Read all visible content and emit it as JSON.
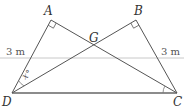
{
  "diagram": {
    "type": "geometry",
    "colors": {
      "line": "#555555",
      "ref_line": "#c8c8c8",
      "text": "#333333"
    },
    "points": {
      "A": {
        "label": "A",
        "x": 51,
        "y": 20
      },
      "B": {
        "label": "B",
        "x": 136,
        "y": 20
      },
      "G": {
        "label": "G",
        "x": 95,
        "y": 46
      },
      "D": {
        "label": "D",
        "x": 12,
        "y": 93
      },
      "C": {
        "label": "C",
        "x": 177,
        "y": 93
      }
    },
    "segments": [
      {
        "from": "D",
        "to": "A"
      },
      {
        "from": "A",
        "to": "C"
      },
      {
        "from": "D",
        "to": "B"
      },
      {
        "from": "B",
        "to": "C"
      },
      {
        "from": "D",
        "to": "C"
      }
    ],
    "right_angles": [
      "A",
      "B"
    ],
    "angle_labels": {
      "D": "x°"
    },
    "measurements": {
      "left": "3 m",
      "right": "3 m"
    }
  }
}
